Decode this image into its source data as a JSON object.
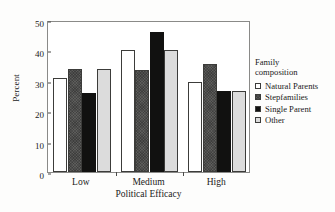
{
  "chart_data": {
    "type": "bar",
    "title": "",
    "xlabel": "Political Efficacy",
    "ylabel": "Percent",
    "categories": [
      "Low",
      "Medium",
      "High"
    ],
    "series": [
      {
        "name": "Natural Parents",
        "values": [
          31,
          40,
          29.5
        ],
        "color": "#ffffff"
      },
      {
        "name": "Stepfamilies",
        "values": [
          34,
          33.7,
          35.5
        ],
        "color": "#5d5d5b"
      },
      {
        "name": "Single Parent",
        "values": [
          26,
          46,
          26.5
        ],
        "color": "#111110"
      },
      {
        "name": "Other",
        "values": [
          34,
          40,
          26.5
        ],
        "color": "#dcdcdc"
      }
    ],
    "ylim": [
      0,
      50
    ],
    "yticks": [
      0,
      10,
      20,
      30,
      40,
      50
    ],
    "ytick_labels": [
      "0",
      "10",
      "20",
      "30",
      "40",
      "50"
    ],
    "grid": false,
    "legend_position": "right",
    "legend_title": "Family\ncomposition"
  }
}
